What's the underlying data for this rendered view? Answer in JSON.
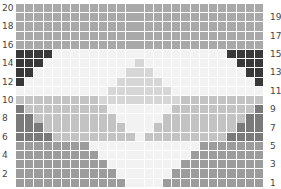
{
  "colors": {
    "A": "#a9a9a9",
    "D": "#383838",
    "L": "#f2f2f2",
    "M": "#d6d6d6",
    "G": "#c3c3c3",
    "E": "#7a7a7a",
    "B": "#9c9c9c"
  },
  "rows": [
    {
      "label": "20",
      "side": "left",
      "cells": "AAAAAAAAAAAAAAAAAAAAAAAAAAA"
    },
    {
      "label": "19",
      "side": "right",
      "cells": "AAAAAAAAAAAAAAAAAAAAAAAAAAA"
    },
    {
      "label": "18",
      "side": "left",
      "cells": "AAAAAAAAAAAAAAAAAAAAAAAAAAA"
    },
    {
      "label": "17",
      "side": "right",
      "cells": "AAAAAAAAAAAAAAAAAAAAAAAAAAA"
    },
    {
      "label": "16",
      "side": "left",
      "cells": "AAAAAAAAAAAAAAAAAAAAAAAAAAA"
    },
    {
      "label": "15",
      "side": "right",
      "cells": "DDDDLLLLLLLLLLLLLLLLLLLDDDD"
    },
    {
      "label": "14",
      "side": "left",
      "cells": "DDDLLLLLLLLLLMLLLLLLLLLLDDD"
    },
    {
      "label": "13",
      "side": "right",
      "cells": "DDLLLLLLLLLLMMMLLLLLLLLLLDD"
    },
    {
      "label": "12",
      "side": "left",
      "cells": "DLLLLLLLLLLMMMMMLLLLLLLLLLD"
    },
    {
      "label": "11",
      "side": "right",
      "cells": "LLLLLLLLLLMMMMMMMLLLLLLLLLL"
    },
    {
      "label": "10",
      "side": "left",
      "cells": "GGGGGGGGGMMMMMMMMMGGGGGGGGG"
    },
    {
      "label": "9",
      "side": "right",
      "cells": "EGGGGGGGGGLLLLLLLGGGGGGGGGE"
    },
    {
      "label": "8",
      "side": "left",
      "cells": "EEGGGGGGGGGLLLLLGGGGGGGGGEE"
    },
    {
      "label": "7",
      "side": "right",
      "cells": "EEEGGGGGGGGGLLLGGGGGGGGGEEE"
    },
    {
      "label": "6",
      "side": "left",
      "cells": "EEEEGGGGGGGGGLGGGGGGGGGEEEE"
    },
    {
      "label": "5",
      "side": "right",
      "cells": "BBBBBBBBLLLLLLLLLLLLBBBBBBB"
    },
    {
      "label": "4",
      "side": "left",
      "cells": "BBBBBBBBBLLLLLLLLLLBBBBBBBB"
    },
    {
      "label": "3",
      "side": "right",
      "cells": "BBBBBBBBBBLLLLLLLLBBBBBBBBB"
    },
    {
      "label": "2",
      "side": "left",
      "cells": "BBBBBBBBBBBLLLLLLBBBBBBBBBB"
    },
    {
      "label": "1",
      "side": "right",
      "cells": "BBBBBBBBBBBBLLLLBBBBBBBBBBB"
    }
  ]
}
